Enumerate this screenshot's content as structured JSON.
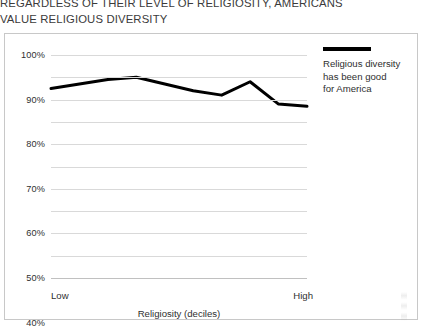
{
  "title": {
    "line1": "REGARDLESS OF THEIR LEVEL OF RELIGIOSITY, AMERICANS",
    "line2": "VALUE RELIGIOUS DIVERSITY"
  },
  "legend": {
    "label_line1": "Religious diversity",
    "label_line2": "has been good",
    "label_line3": "for America",
    "swatch_color": "#000000"
  },
  "axis": {
    "x_title": "Religiosity (deciles)",
    "x_low_label": "Low",
    "x_high_label": "High"
  },
  "colors": {
    "series_line": "#000000",
    "gridline": "#d9d9d9",
    "frame_border": "#c8c8c8",
    "text": "#2f2f2f"
  },
  "chart_data": {
    "type": "line",
    "title": "REGARDLESS OF THEIR LEVEL OF RELIGIOSITY, AMERICANS VALUE RELIGIOUS DIVERSITY",
    "xlabel": "Religiosity (deciles)",
    "ylabel": "",
    "ylim": [
      0,
      100
    ],
    "yticks": [
      0,
      10,
      20,
      30,
      40,
      50,
      60,
      70,
      80,
      90,
      100
    ],
    "ytick_labels": [
      "0%",
      "10%",
      "20%",
      "30%",
      "40%",
      "50%",
      "60%",
      "70%",
      "80%",
      "90%",
      "100%"
    ],
    "grid": true,
    "legend_position": "top-right",
    "x": [
      1,
      2,
      3,
      4,
      5,
      6,
      7,
      8,
      9,
      10
    ],
    "x_endpoint_labels": [
      "Low",
      "High"
    ],
    "series": [
      {
        "name": "Religious diversity has been good for America",
        "color": "#000000",
        "values": [
          85,
          87,
          89,
          90,
          87,
          84,
          82,
          88,
          78,
          77
        ]
      }
    ]
  }
}
